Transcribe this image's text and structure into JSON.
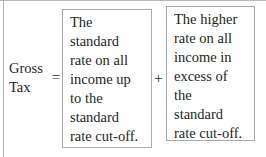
{
  "equation": {
    "left_side": {
      "name": "Gross Tax",
      "lines": [
        "Gross",
        "Tax"
      ]
    },
    "operators": {
      "equals": "=",
      "plus": "+"
    },
    "terms": [
      {
        "id": "standard-rate-band",
        "lines": [
          "The",
          "standard",
          "rate on all",
          "income up",
          "to the",
          "standard",
          "rate cut-off."
        ],
        "full_text": "The standard rate on all income up to the standard rate cut-off."
      },
      {
        "id": "higher-rate-band",
        "lines": [
          "The higher",
          "rate on all",
          "income in",
          "excess of",
          "the",
          "standard",
          "rate cut-off."
        ],
        "full_text": "The higher rate on all income in excess of the standard rate cut-off."
      }
    ]
  },
  "style": {
    "text_color": "#231f20",
    "box_border_color": "#a9a9a9",
    "background_color": "#ffffff",
    "edge_rule_color": "#b9b9b9"
  }
}
